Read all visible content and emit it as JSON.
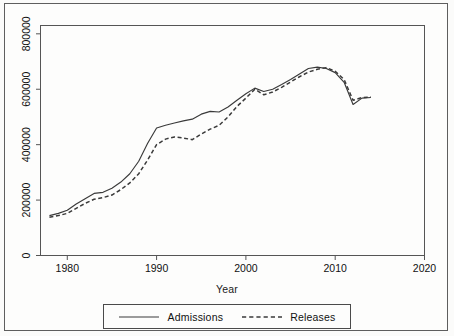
{
  "figure": {
    "background_color": "#fdfdfc",
    "frame_color": "#5e5e5e",
    "line_color": "#3a3a3a"
  },
  "axis": {
    "x_title": "Year",
    "y_title": ""
  },
  "legend": {
    "entries": [
      {
        "label": "Admissions",
        "style": "solid",
        "icon": "solid-line-swatch"
      },
      {
        "label": "Releases",
        "style": "dashed",
        "icon": "dashed-line-swatch"
      }
    ]
  },
  "chart_data": {
    "type": "line",
    "title": "",
    "subtitle": "",
    "xlabel": "Year",
    "ylabel": "",
    "xlim": [
      1977,
      2020
    ],
    "ylim": [
      0,
      830000
    ],
    "xticks": [
      1980,
      1990,
      2000,
      2010,
      2020
    ],
    "xtick_labels": [
      "1980",
      "1990",
      "2000",
      "2010",
      "2020"
    ],
    "yticks": [
      0,
      200000,
      400000,
      600000,
      800000
    ],
    "ytick_labels": [
      "0",
      "200000",
      "400000",
      "600000",
      "800000"
    ],
    "grid": false,
    "legend_position": "below-axes",
    "x": [
      1978,
      1979,
      1980,
      1981,
      1982,
      1983,
      1984,
      1985,
      1986,
      1987,
      1988,
      1989,
      1990,
      1991,
      1992,
      1993,
      1994,
      1995,
      1996,
      1997,
      1998,
      1999,
      2000,
      2001,
      2002,
      2003,
      2004,
      2005,
      2006,
      2007,
      2008,
      2009,
      2010,
      2011,
      2012,
      2013,
      2014
    ],
    "series": [
      {
        "name": "Admissions",
        "style": "solid",
        "values": [
          144000,
          152000,
          163000,
          186000,
          205000,
          224000,
          228000,
          243000,
          265000,
          295000,
          340000,
          405000,
          460000,
          470000,
          478000,
          486000,
          492000,
          510000,
          520000,
          518000,
          536000,
          560000,
          584000,
          604000,
          592000,
          600000,
          617000,
          635000,
          655000,
          675000,
          680000,
          675000,
          660000,
          625000,
          545000,
          568000,
          570000
        ]
      },
      {
        "name": "Releases",
        "style": "dashed",
        "values": [
          138000,
          144000,
          152000,
          170000,
          188000,
          203000,
          209000,
          218000,
          238000,
          262000,
          295000,
          345000,
          400000,
          420000,
          428000,
          424000,
          418000,
          438000,
          456000,
          470000,
          500000,
          538000,
          568000,
          600000,
          580000,
          590000,
          607000,
          626000,
          645000,
          662000,
          672000,
          678000,
          665000,
          635000,
          560000,
          570000,
          572000
        ]
      }
    ]
  }
}
